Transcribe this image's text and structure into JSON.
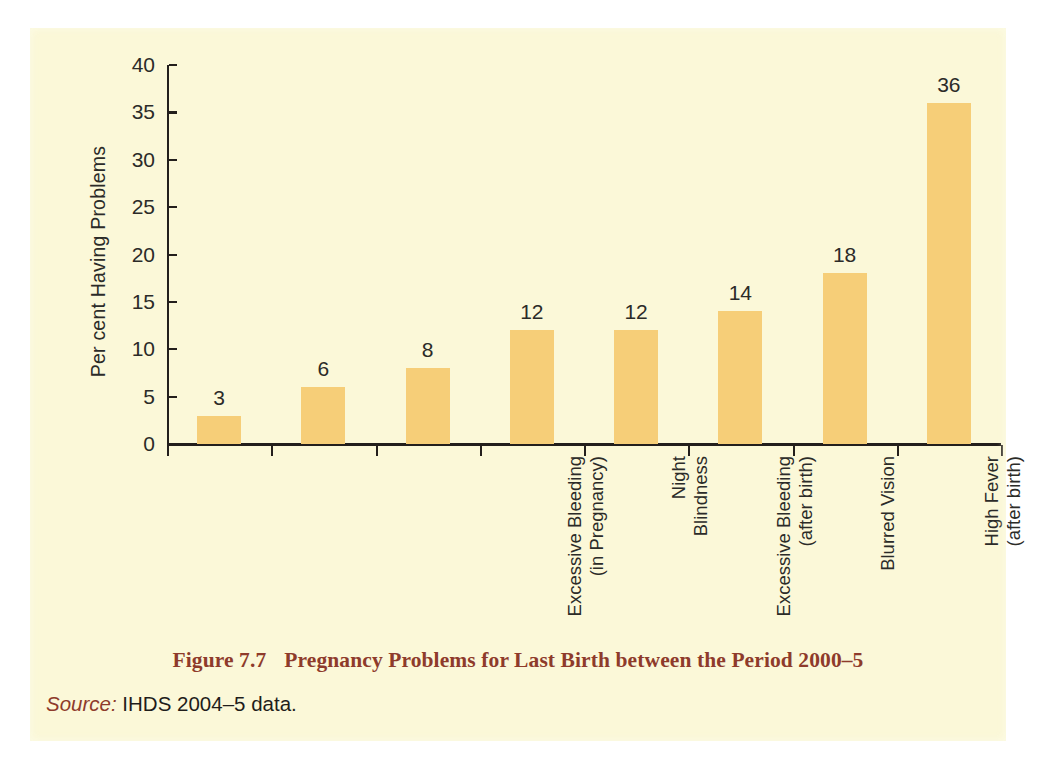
{
  "chart_data": {
    "type": "bar",
    "title": "Pregnancy Problems for Last Birth between the Period 2000–5",
    "xlabel": "",
    "ylabel": "Per cent Having Problems",
    "ylim": [
      0,
      40
    ],
    "ytick_step": 5,
    "grid": false,
    "legend": null,
    "bar_color": "#F6CE78",
    "categories": [
      "Excessive Bleeding\n(in Pregnancy)",
      "Night\nBlindness",
      "Excessive Bleeding\n(after birth)",
      "Blurred Vision",
      "High Fever\n(after birth)",
      "Convulsions",
      "Anaemia",
      "Fatigue"
    ],
    "values": [
      3,
      6,
      8,
      12,
      12,
      14,
      18,
      36
    ],
    "value_labels": [
      "3",
      "6",
      "8",
      "12",
      "12",
      "14",
      "18",
      "36"
    ],
    "ytick_labels": [
      "40",
      "35",
      "30",
      "25",
      "20",
      "15",
      "10",
      "5",
      "0"
    ],
    "ytick_values": [
      40,
      35,
      30,
      25,
      20,
      15,
      10,
      5,
      0
    ]
  },
  "caption": {
    "figure_number": "Figure 7.7",
    "text": "Pregnancy Problems for Last Birth between the Period 2000–5",
    "color": "#8E3B2B"
  },
  "source": {
    "label": "Source:",
    "text": "IHDS 2004–5 data."
  },
  "page": {
    "background": "#FBF8D8"
  }
}
